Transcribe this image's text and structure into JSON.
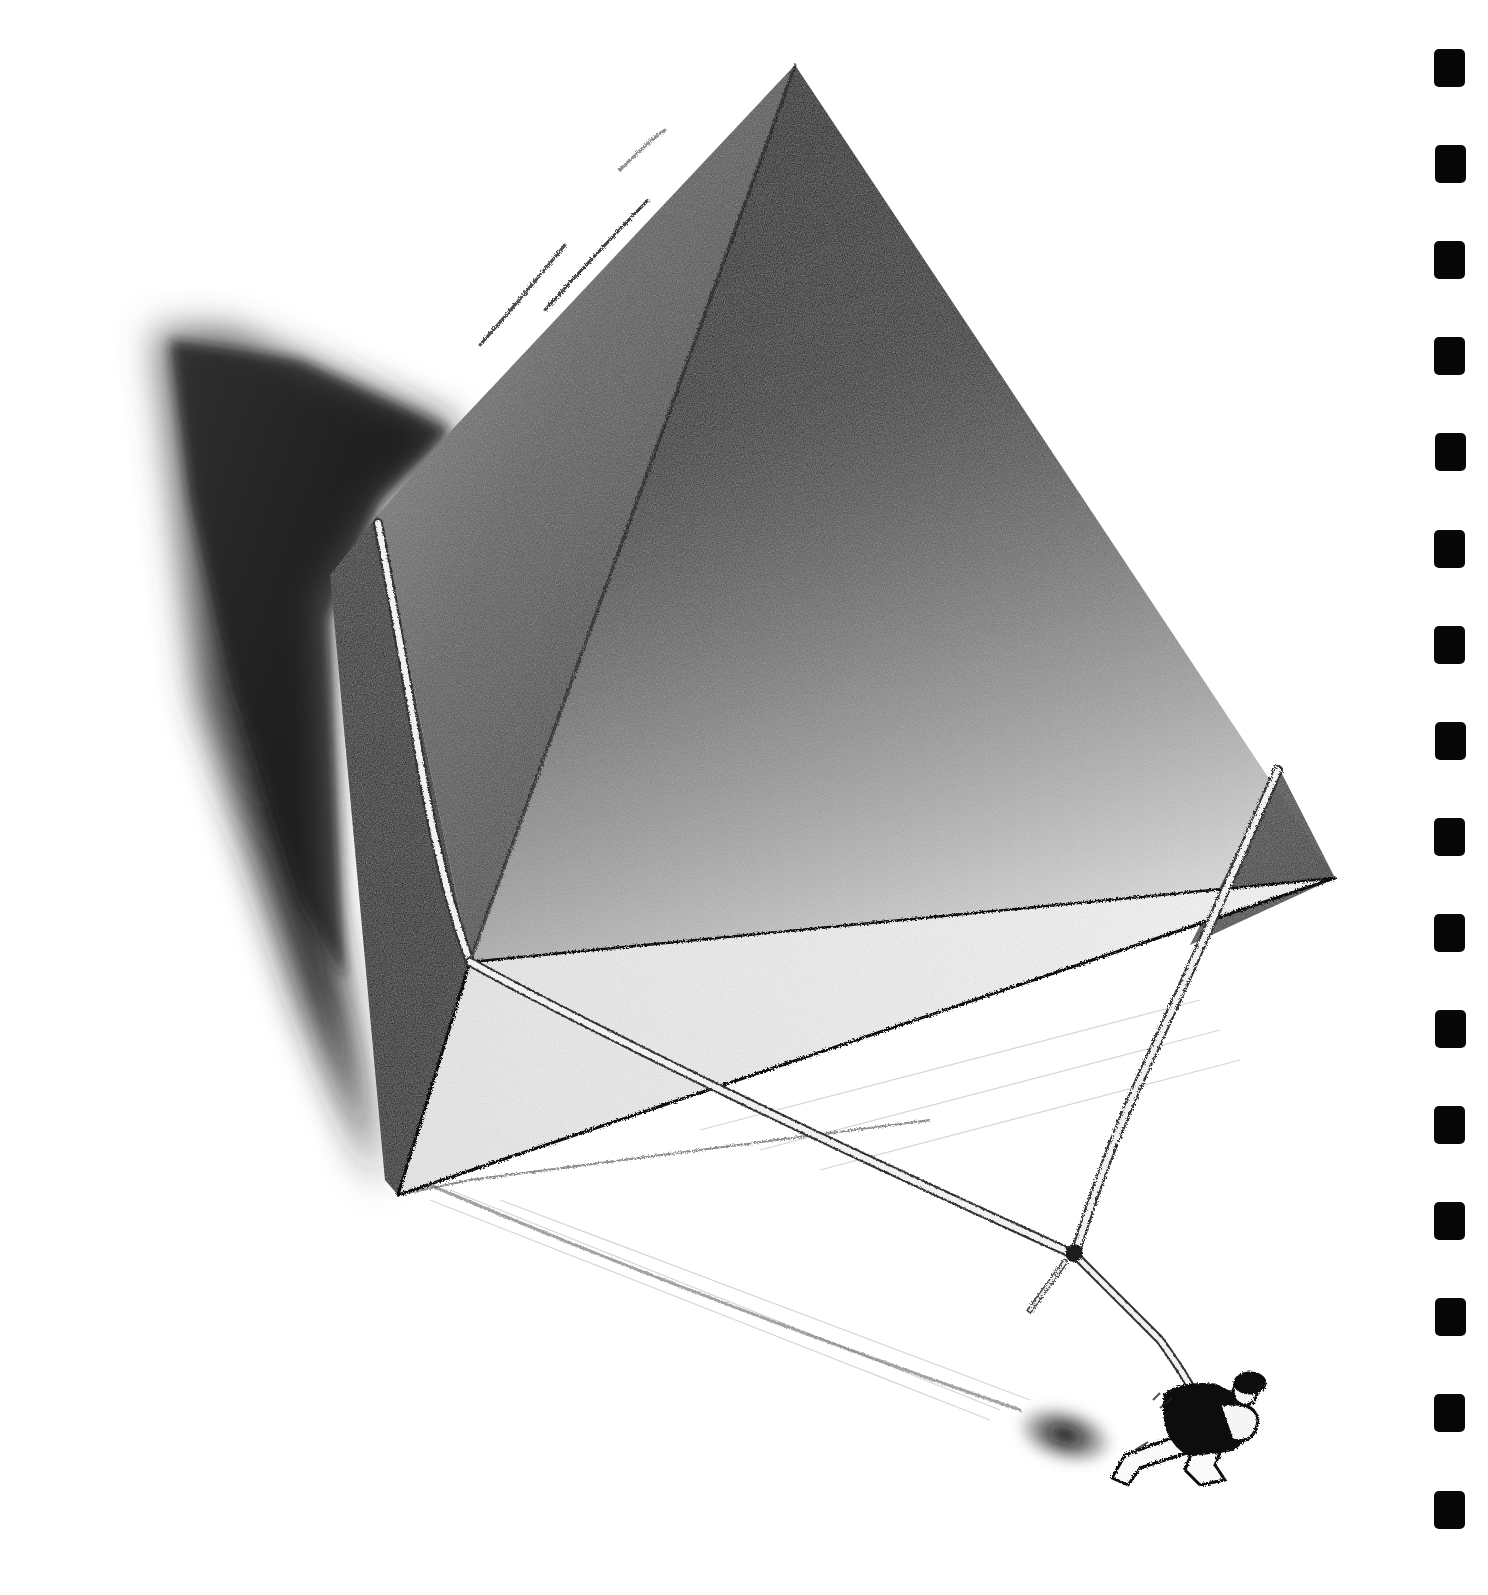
{
  "artwork": {
    "description": "Charcoal drawing of a giant pyramid-shaped block bound with rope, hauled by a small figure",
    "subject": "pyramid-tied-with-rope",
    "figure": "man-pulling-rope",
    "palette": {
      "paper": "#ffffff",
      "charcoal_dark": "#0a0a0a",
      "charcoal_mid": "#3a3a3a",
      "charcoal_light": "#9a9a9a",
      "rope": "#f2f2f2"
    }
  },
  "film_strip": {
    "perforation_count": 16,
    "color": "#070707"
  }
}
